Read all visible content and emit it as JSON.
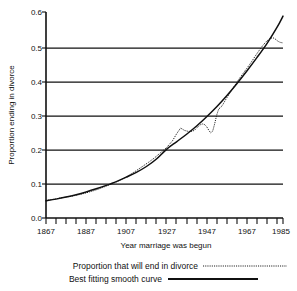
{
  "chart_data": {
    "type": "line",
    "title": "",
    "xlabel": "Year marriage was begun",
    "ylabel": "Proportion ending in divorce",
    "xlim": [
      1867,
      1985
    ],
    "ylim": [
      0.0,
      0.6
    ],
    "grid": "horizontal",
    "legend_position": "below",
    "x_ticks": [
      1867,
      1887,
      1907,
      1927,
      1947,
      1967,
      1985
    ],
    "x_tick_labels": [
      "1867",
      "1887",
      "1907",
      "1927",
      "1947",
      "1967",
      "1985"
    ],
    "x_minor_tick_step": 5,
    "y_ticks": [
      0.0,
      0.1,
      0.2,
      0.3,
      0.4,
      0.5,
      0.6
    ],
    "y_tick_labels": [
      "0.0",
      "0.1",
      "0.2",
      "0.3",
      "0.4",
      "0.5",
      "0.6"
    ],
    "series": [
      {
        "name": "Proportion that will end in divorce",
        "style": "dotted",
        "color": "#1a1a1a",
        "x": [
          1867,
          1870,
          1873,
          1876,
          1879,
          1882,
          1885,
          1888,
          1891,
          1894,
          1897,
          1900,
          1903,
          1906,
          1909,
          1912,
          1915,
          1918,
          1921,
          1924,
          1927,
          1930,
          1932,
          1934,
          1936,
          1938,
          1940,
          1941,
          1942,
          1943,
          1944,
          1945,
          1946,
          1947,
          1948,
          1949,
          1950,
          1951,
          1952,
          1953,
          1954,
          1955,
          1957,
          1959,
          1961,
          1963,
          1965,
          1967,
          1969,
          1971,
          1973,
          1975,
          1977,
          1979,
          1980,
          1981,
          1982,
          1983,
          1984,
          1985
        ],
        "y": [
          0.051,
          0.054,
          0.057,
          0.06,
          0.063,
          0.066,
          0.07,
          0.075,
          0.08,
          0.086,
          0.093,
          0.1,
          0.108,
          0.117,
          0.127,
          0.138,
          0.15,
          0.162,
          0.175,
          0.19,
          0.205,
          0.225,
          0.245,
          0.262,
          0.255,
          0.252,
          0.253,
          0.256,
          0.262,
          0.268,
          0.272,
          0.274,
          0.272,
          0.266,
          0.256,
          0.248,
          0.253,
          0.275,
          0.3,
          0.318,
          0.322,
          0.33,
          0.35,
          0.368,
          0.386,
          0.404,
          0.42,
          0.436,
          0.452,
          0.47,
          0.487,
          0.503,
          0.516,
          0.524,
          0.525,
          0.522,
          0.517,
          0.513,
          0.511,
          0.51
        ]
      },
      {
        "name": "Best fitting smooth curve",
        "style": "solid",
        "color": "#101010",
        "x": [
          1867,
          1872,
          1877,
          1882,
          1887,
          1892,
          1897,
          1902,
          1907,
          1912,
          1917,
          1922,
          1927,
          1932,
          1937,
          1942,
          1947,
          1952,
          1957,
          1962,
          1967,
          1972,
          1977,
          1982,
          1985
        ],
        "y": [
          0.05,
          0.055,
          0.061,
          0.068,
          0.076,
          0.085,
          0.095,
          0.106,
          0.119,
          0.133,
          0.15,
          0.172,
          0.2,
          0.222,
          0.244,
          0.268,
          0.295,
          0.324,
          0.356,
          0.391,
          0.428,
          0.467,
          0.508,
          0.555,
          0.588
        ]
      }
    ]
  },
  "legend": {
    "items": [
      {
        "label": "Proportion that will end in divorce",
        "style": "dotted"
      },
      {
        "label": "Best fitting smooth curve",
        "style": "solid"
      }
    ]
  }
}
